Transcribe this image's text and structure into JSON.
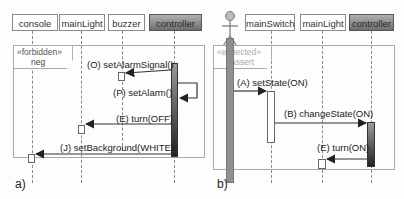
{
  "panel_a": {
    "label": "a)",
    "lifelines": [
      "console",
      "mainLight",
      "buzzer",
      "controller"
    ],
    "fragment": {
      "stereotype": "«forbidden»",
      "operator": "neg"
    },
    "messages": [
      {
        "label": "(O) setAlarmSignal()",
        "from": "controller",
        "to": "buzzer"
      },
      {
        "label": "(P) setAlarm()",
        "from": "controller",
        "to": "controller"
      },
      {
        "label": "(E) turn(OFF)",
        "from": "controller",
        "to": "mainLight"
      },
      {
        "label": "(J) setBackground(WHITE)",
        "from": "controller",
        "to": "console"
      }
    ]
  },
  "panel_b": {
    "label": "b)",
    "actor": "stick-figure",
    "lifelines": [
      "mainSwitch",
      "mainLight",
      "controller"
    ],
    "fragment": {
      "stereotype": "«expected»",
      "operator": "assert"
    },
    "messages": [
      {
        "label": "(A) setState(ON)",
        "from": "actor",
        "to": "mainSwitch"
      },
      {
        "label": "(B) changeState(ON)",
        "from": "mainSwitch",
        "to": "controller"
      },
      {
        "label": "(E) turn(ON)",
        "from": "controller",
        "to": "mainLight"
      }
    ]
  },
  "colors": {
    "line": "#888888",
    "controller_head": "#8a8a8a",
    "text": "#222222"
  }
}
